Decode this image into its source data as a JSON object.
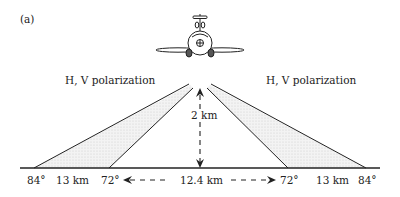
{
  "panel_label": "(a)",
  "beams": {
    "left_label": "H, V polarization",
    "right_label": "H, V polarization"
  },
  "altitude_label": "2 km",
  "ground": {
    "left_outer_angle": "84°",
    "left_swath": "13 km",
    "left_inner_angle": "72°",
    "center_gap": "12.4 km",
    "right_inner_angle": "72°",
    "right_swath": "13 km",
    "right_outer_angle": "84°"
  },
  "colors": {
    "line": "#222222",
    "beam_fill": "#e4e4e4"
  }
}
